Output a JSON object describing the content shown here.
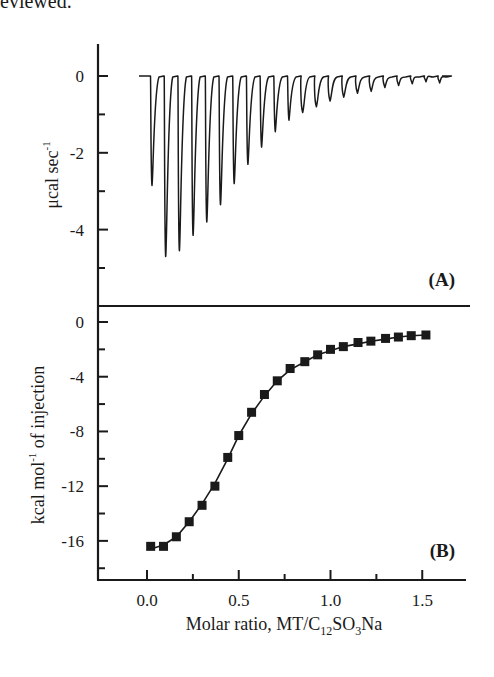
{
  "header_fragment": "eviewed.",
  "chart_data": [
    {
      "type": "line",
      "panel_label": "(A)",
      "title": "",
      "xlabel": "",
      "ylabel": "μcal sec⁻¹",
      "ylabel_parts": {
        "main": "μcal sec",
        "sup": "-1"
      },
      "yticks": [
        "0",
        "-2",
        "-4"
      ],
      "ytick_values": [
        0,
        -2,
        -4
      ],
      "ylim": [
        -5.2,
        0.8
      ],
      "minor_yticks": [
        -1,
        -3,
        -5
      ],
      "grid": false,
      "description": "Raw ITC thermogram: 22 exothermic injection peaks returning to a 0 baseline",
      "series": [
        {
          "name": "heat flow peaks",
          "peak_minima": [
            -2.85,
            -4.7,
            -4.55,
            -4.15,
            -3.8,
            -3.35,
            -2.8,
            -2.3,
            -1.85,
            -1.45,
            -1.15,
            -0.95,
            -0.8,
            -0.65,
            -0.55,
            -0.45,
            -0.4,
            -0.3,
            -0.25,
            -0.2,
            -0.15,
            -0.18
          ]
        }
      ]
    },
    {
      "type": "scatter",
      "panel_label": "(B)",
      "title": "",
      "xlabel": "Molar ratio, MT/C12SO3Na",
      "xlabel_parts": {
        "pre": "Molar ratio, MT/C",
        "sub1": "12",
        "mid": "SO",
        "sub2": "3",
        "post": "Na"
      },
      "ylabel": "kcal mol⁻¹ of injection",
      "ylabel_parts": {
        "pre": "kcal mol",
        "sup": "-1",
        "post": " of injection"
      },
      "xticks": [
        "0.0",
        "0.5",
        "1.0",
        "1.5"
      ],
      "xtick_values": [
        0.0,
        0.5,
        1.0,
        1.5
      ],
      "xlim": [
        -0.27,
        1.73
      ],
      "yticks": [
        "0",
        "-4",
        "-8",
        "-12",
        "-16"
      ],
      "ytick_values": [
        0,
        -4,
        -8,
        -12,
        -16
      ],
      "ylim": [
        -18.8,
        1.1
      ],
      "grid": false,
      "series": [
        {
          "name": "integrated heats",
          "marker": "filled-square",
          "x": [
            0.02,
            0.09,
            0.16,
            0.23,
            0.3,
            0.37,
            0.44,
            0.5,
            0.57,
            0.64,
            0.71,
            0.78,
            0.86,
            0.93,
            1.0,
            1.07,
            1.15,
            1.22,
            1.3,
            1.37,
            1.44,
            1.52
          ],
          "values": [
            -16.4,
            -16.4,
            -15.7,
            -14.6,
            -13.4,
            -12.0,
            -9.9,
            -8.3,
            -6.6,
            -5.3,
            -4.3,
            -3.4,
            -2.9,
            -2.4,
            -2.0,
            -1.8,
            -1.5,
            -1.4,
            -1.2,
            -1.1,
            -1.0,
            -0.95
          ]
        },
        {
          "name": "fit",
          "style": "solid-line",
          "x": [
            0.02,
            0.09,
            0.16,
            0.23,
            0.3,
            0.37,
            0.44,
            0.5,
            0.57,
            0.64,
            0.71,
            0.78,
            0.86,
            0.93,
            1.0,
            1.07,
            1.15,
            1.22,
            1.3,
            1.37,
            1.44,
            1.52
          ],
          "values": [
            -16.6,
            -16.3,
            -15.7,
            -14.6,
            -13.3,
            -11.8,
            -10.0,
            -8.3,
            -6.7,
            -5.4,
            -4.3,
            -3.5,
            -2.9,
            -2.4,
            -2.1,
            -1.8,
            -1.6,
            -1.4,
            -1.25,
            -1.1,
            -1.0,
            -0.95
          ]
        }
      ]
    }
  ]
}
